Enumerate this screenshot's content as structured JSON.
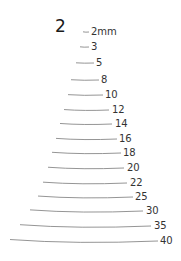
{
  "title": "2",
  "colors": {
    "line": "#7a7a7a",
    "text": "#333333",
    "title": "#1a1a1a",
    "background": "#ffffff"
  },
  "gauges": [
    {
      "label": "2mm",
      "x1": 83,
      "x2": 89,
      "y": 32,
      "labelX": 91
    },
    {
      "label": "3",
      "x1": 80,
      "x2": 89,
      "y": 47,
      "labelX": 91
    },
    {
      "label": "5",
      "x1": 76,
      "x2": 94,
      "y": 63,
      "labelX": 96
    },
    {
      "label": "8",
      "x1": 71,
      "x2": 99,
      "y": 80,
      "labelX": 101
    },
    {
      "label": "10",
      "x1": 68,
      "x2": 103,
      "y": 95,
      "labelX": 105
    },
    {
      "label": "12",
      "x1": 64,
      "x2": 109,
      "y": 110,
      "labelX": 112
    },
    {
      "label": "14",
      "x1": 60,
      "x2": 112,
      "y": 124,
      "labelX": 115
    },
    {
      "label": "16",
      "x1": 56,
      "x2": 117,
      "y": 139,
      "labelX": 119
    },
    {
      "label": "18",
      "x1": 52,
      "x2": 121,
      "y": 153,
      "labelX": 123
    },
    {
      "label": "20",
      "x1": 48,
      "x2": 124,
      "y": 168,
      "labelX": 127
    },
    {
      "label": "22",
      "x1": 43,
      "x2": 127,
      "y": 183,
      "labelX": 130
    },
    {
      "label": "25",
      "x1": 38,
      "x2": 133,
      "y": 197,
      "labelX": 135
    },
    {
      "label": "30",
      "x1": 30,
      "x2": 143,
      "y": 211,
      "labelX": 146
    },
    {
      "label": "35",
      "x1": 20,
      "x2": 151,
      "y": 226,
      "labelX": 154
    },
    {
      "label": "40",
      "x1": 10,
      "x2": 158,
      "y": 241,
      "labelX": 160
    }
  ]
}
